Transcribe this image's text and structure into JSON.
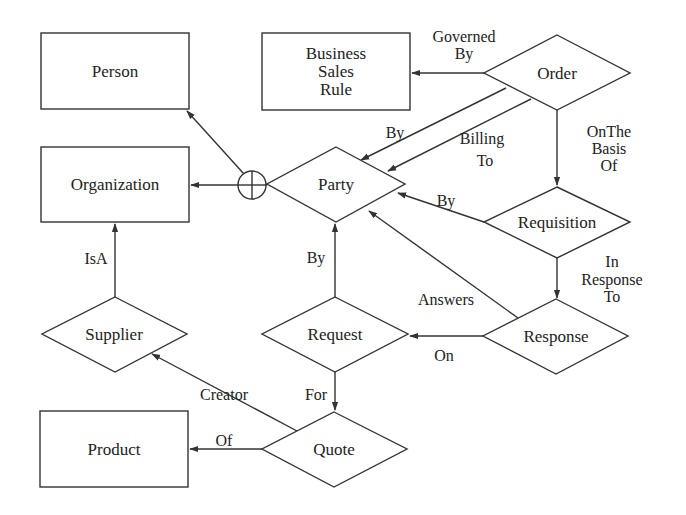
{
  "diagram": {
    "type": "entity-relationship",
    "colors": {
      "stroke": "#333333",
      "text": "#222222",
      "background": "#ffffff"
    },
    "entities": [
      {
        "id": "person",
        "label": "Person",
        "shape": "rectangle"
      },
      {
        "id": "business_sales_rule",
        "label_lines": [
          "Business",
          "Sales",
          "Rule"
        ],
        "shape": "rectangle"
      },
      {
        "id": "organization",
        "label": "Organization",
        "shape": "rectangle"
      },
      {
        "id": "product",
        "label": "Product",
        "shape": "rectangle"
      }
    ],
    "relationships": [
      {
        "id": "order",
        "label": "Order",
        "shape": "diamond"
      },
      {
        "id": "party",
        "label": "Party",
        "shape": "diamond"
      },
      {
        "id": "requisition",
        "label": "Requisition",
        "shape": "diamond"
      },
      {
        "id": "supplier",
        "label": "Supplier",
        "shape": "diamond"
      },
      {
        "id": "request",
        "label": "Request",
        "shape": "diamond"
      },
      {
        "id": "response",
        "label": "Response",
        "shape": "diamond"
      },
      {
        "id": "quote",
        "label": "Quote",
        "shape": "diamond"
      }
    ],
    "union_symbol": {
      "id": "party-union",
      "glyph": "circle-plus"
    },
    "edges": [
      {
        "from": "party-union",
        "to": "person",
        "label": ""
      },
      {
        "from": "party-union",
        "to": "organization",
        "label": ""
      },
      {
        "from": "party",
        "to": "party-union",
        "label": ""
      },
      {
        "from": "order",
        "to": "business_sales_rule",
        "label_lines": [
          "Governed",
          "By"
        ]
      },
      {
        "from": "order",
        "to": "party",
        "label": "By"
      },
      {
        "from": "order",
        "to": "party",
        "label_lines": [
          "Billing",
          "To"
        ]
      },
      {
        "from": "order",
        "to": "requisition",
        "label_lines": [
          "OnThe",
          "Basis",
          "Of"
        ]
      },
      {
        "from": "requisition",
        "to": "party",
        "label": "By"
      },
      {
        "from": "requisition",
        "to": "response",
        "label_lines": [
          "In",
          "Response",
          "To"
        ]
      },
      {
        "from": "response",
        "to": "party",
        "label": "Answers"
      },
      {
        "from": "response",
        "to": "request",
        "label": "On"
      },
      {
        "from": "request",
        "to": "party",
        "label": "By"
      },
      {
        "from": "request",
        "to": "quote",
        "label": "For"
      },
      {
        "from": "quote",
        "to": "supplier",
        "label": "Creator"
      },
      {
        "from": "quote",
        "to": "product",
        "label": "Of"
      },
      {
        "from": "supplier",
        "to": "organization",
        "label": "IsA"
      }
    ]
  }
}
